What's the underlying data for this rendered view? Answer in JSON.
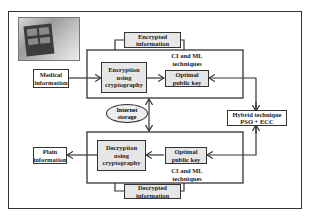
{
  "diagram": {
    "type": "flowchart",
    "photo": {
      "description": "tablet device showing medical data",
      "icon": "medical-tablet-photo"
    },
    "nodes": {
      "medical_information": "Medical information",
      "encrypted_information": "Encrypted information",
      "encryption": "Encryption using cryptography",
      "ci_ml_top": "CI and ML techniques",
      "optimal_key_top": "Optimal public key",
      "internet_storage": "Internet storage",
      "hybrid": "Hybrid technique PSO + ECC",
      "plain_information": "Plain information",
      "decryption": "Decryption using cryptography",
      "optimal_key_bottom": "Optimal public key",
      "ci_ml_bottom": "CI and ML techniques",
      "decrypted_information": "Decrypted information"
    },
    "edges": [
      {
        "from": "Medical information",
        "to": "Encryption using cryptography"
      },
      {
        "from": "Encryption using cryptography",
        "to": "Optimal public key"
      },
      {
        "from": "Hybrid technique PSO + ECC",
        "to": "Optimal public key (top)"
      },
      {
        "from": "Hybrid technique PSO + ECC",
        "to": "Optimal public key (bottom)"
      },
      {
        "from": "Internet storage",
        "to": "Encryption / Decryption blocks",
        "bidirectional": true
      },
      {
        "from": "Optimal public key (bottom)",
        "to": "Decryption using cryptography"
      },
      {
        "from": "Decryption using cryptography",
        "to": "Plain information"
      }
    ]
  }
}
